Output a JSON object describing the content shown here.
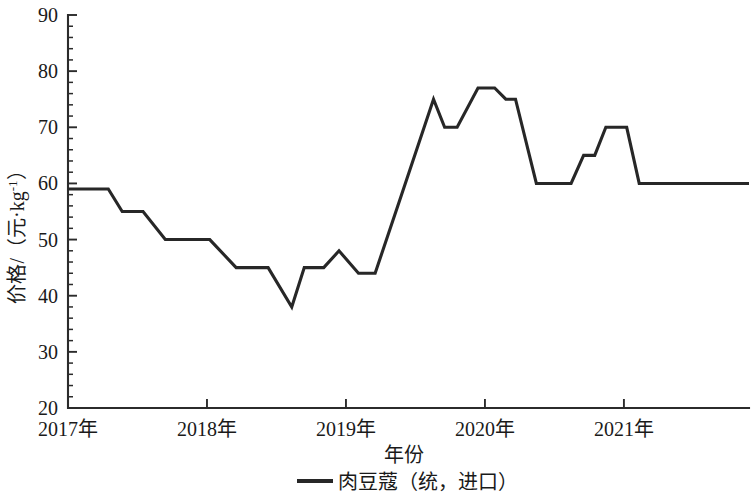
{
  "chart_data": {
    "type": "line",
    "title": "",
    "xlabel": "年份",
    "ylabel": "价格/（元·kg⁻¹）",
    "ylabel_parts": {
      "main": "价格/（元·kg",
      "exponent": "-1",
      "tail": "）"
    },
    "legend": [
      {
        "name": "肉豆蔻（统，进口）",
        "color": "#272727",
        "marker": "line"
      }
    ],
    "legend_position": "bottom-center",
    "grid": false,
    "xlim": [
      2017.0,
      2021.9
    ],
    "ylim": [
      20,
      90
    ],
    "y_ticks": [
      20,
      30,
      40,
      50,
      60,
      70,
      80,
      90
    ],
    "y_tick_labels": [
      "20",
      "30",
      "40",
      "50",
      "60",
      "70",
      "80",
      "90"
    ],
    "y_minor_step": 2,
    "x_ticks": [
      2017,
      2018,
      2019,
      2020,
      2021
    ],
    "x_tick_labels": [
      "2017年",
      "2018年",
      "2019年",
      "2020年",
      "2021年"
    ],
    "series": [
      {
        "name": "肉豆蔻（统，进口）",
        "points": [
          {
            "x": 2017.0,
            "y": 59
          },
          {
            "x": 2017.29,
            "y": 59
          },
          {
            "x": 2017.39,
            "y": 55
          },
          {
            "x": 2017.54,
            "y": 55
          },
          {
            "x": 2017.7,
            "y": 50
          },
          {
            "x": 2018.02,
            "y": 50
          },
          {
            "x": 2018.21,
            "y": 45
          },
          {
            "x": 2018.44,
            "y": 45
          },
          {
            "x": 2018.61,
            "y": 38
          },
          {
            "x": 2018.7,
            "y": 45
          },
          {
            "x": 2018.84,
            "y": 45
          },
          {
            "x": 2018.95,
            "y": 48
          },
          {
            "x": 2019.09,
            "y": 44
          },
          {
            "x": 2019.21,
            "y": 44
          },
          {
            "x": 2019.4,
            "y": 58
          },
          {
            "x": 2019.63,
            "y": 75
          },
          {
            "x": 2019.71,
            "y": 70
          },
          {
            "x": 2019.8,
            "y": 70
          },
          {
            "x": 2019.95,
            "y": 77
          },
          {
            "x": 2020.07,
            "y": 77
          },
          {
            "x": 2020.15,
            "y": 75
          },
          {
            "x": 2020.22,
            "y": 75
          },
          {
            "x": 2020.37,
            "y": 60
          },
          {
            "x": 2020.62,
            "y": 60
          },
          {
            "x": 2020.71,
            "y": 65
          },
          {
            "x": 2020.79,
            "y": 65
          },
          {
            "x": 2020.87,
            "y": 70
          },
          {
            "x": 2021.02,
            "y": 70
          },
          {
            "x": 2021.11,
            "y": 60
          },
          {
            "x": 2021.9,
            "y": 60
          }
        ]
      }
    ]
  }
}
